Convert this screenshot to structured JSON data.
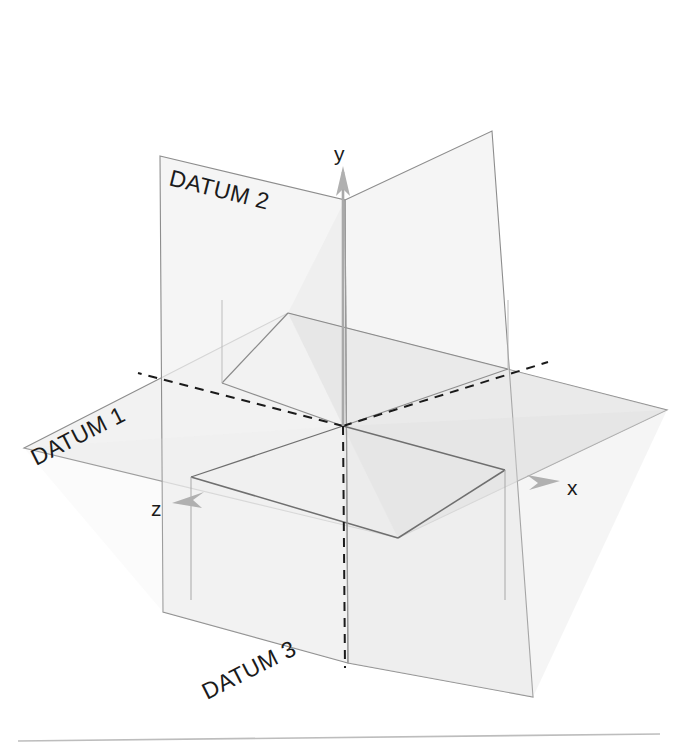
{
  "figure": {
    "background_color": "#ffffff",
    "baseline_rule_color": "#b9b9b9"
  },
  "colors": {
    "plane_fill": "#f1f1f1",
    "plane_fill_overlap": "#e6e6e6",
    "plane_edge": "#8d8d8d",
    "intersection_line": "#7a7a7a",
    "hidden_line": "#1a1a1a",
    "axis_line": "#9e9e9e",
    "axis_arrow": "#b0b0b0",
    "text": "#1b1b1b"
  },
  "planes": [
    {
      "id": "datum-1",
      "label": "DATUM 1",
      "orientation": "horizontal",
      "label_rotation_deg": -27,
      "label_x": 36,
      "label_y": 466,
      "points": "24,448 288,313 667,410 398,538"
    },
    {
      "id": "datum-2",
      "label": "DATUM 2",
      "orientation": "vertical-frontal",
      "label_rotation_deg": 14,
      "label_x": 168,
      "label_y": 185,
      "points": "160,156 345,200 348,663 163,612"
    },
    {
      "id": "datum-3",
      "label": "DATUM 3",
      "orientation": "vertical-profile",
      "label_rotation_deg": -27,
      "label_x": 207,
      "label_y": 700,
      "points": "345,200 492,131 533,697 348,663"
    }
  ],
  "axes": [
    {
      "id": "axis-y",
      "label": "y",
      "label_x": 334,
      "label_y": 161,
      "direction": "up"
    },
    {
      "id": "axis-x",
      "label": "x",
      "label_x": 567,
      "label_y": 495,
      "direction": "right"
    },
    {
      "id": "axis-z",
      "label": "z",
      "label_x": 151,
      "label_y": 516,
      "direction": "down-left"
    }
  ],
  "origin": {
    "x": 343,
    "y": 426
  }
}
